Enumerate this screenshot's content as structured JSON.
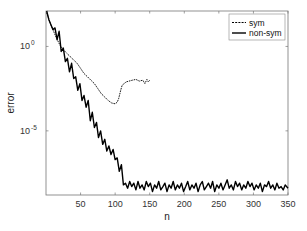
{
  "chart_data": {
    "type": "line",
    "title": "",
    "xlabel": "n",
    "ylabel": "error",
    "xscale": "linear",
    "yscale": "log",
    "xlim": [
      1,
      350
    ],
    "ylim_log10": [
      -8.8,
      2.1
    ],
    "grid": false,
    "legend_position": "upper right",
    "xticks": [
      50,
      100,
      150,
      200,
      250,
      300,
      350
    ],
    "xtick_labels": [
      "50",
      "100",
      "150",
      "200",
      "250",
      "300",
      "350"
    ],
    "yticks_log10": [
      0,
      -5
    ],
    "ytick_labels": [
      {
        "base": "10",
        "exp": "0"
      },
      {
        "base": "10",
        "exp": "-5"
      }
    ],
    "series": [
      {
        "name": "sym",
        "style": "dashed",
        "color": "#000000",
        "n": [
          1,
          5,
          10,
          15,
          20,
          25,
          30,
          35,
          40,
          45,
          50,
          55,
          60,
          65,
          70,
          75,
          80,
          85,
          90,
          95,
          100,
          103,
          105,
          108,
          110,
          113,
          116,
          120,
          125,
          130,
          135,
          140,
          143,
          146,
          148,
          150
        ],
        "log10_error": [
          2.0,
          1.5,
          1.0,
          0.5,
          0.1,
          -0.2,
          -0.4,
          -0.6,
          -0.8,
          -1.0,
          -1.3,
          -1.6,
          -1.8,
          -2.0,
          -2.2,
          -2.5,
          -2.8,
          -3.0,
          -3.2,
          -3.35,
          -3.4,
          -3.3,
          -3.1,
          -2.6,
          -2.3,
          -2.2,
          -2.1,
          -2.05,
          -2.0,
          -1.95,
          -2.05,
          -2.0,
          -2.2,
          -1.95,
          -2.1,
          -2.0
        ]
      },
      {
        "name": "non-sym",
        "style": "solid",
        "color": "#000000",
        "n": [
          1,
          4,
          7,
          10,
          13,
          16,
          19,
          22,
          25,
          28,
          31,
          34,
          37,
          40,
          43,
          46,
          49,
          52,
          55,
          58,
          61,
          64,
          67,
          70,
          73,
          76,
          79,
          82,
          85,
          88,
          91,
          94,
          97,
          100,
          103,
          106,
          109,
          112,
          115,
          118,
          121,
          124,
          127,
          130,
          133,
          136,
          139,
          142,
          145,
          148,
          151,
          154,
          157,
          160,
          163,
          166,
          169,
          172,
          175,
          178,
          181,
          184,
          187,
          190,
          193,
          196,
          199,
          202,
          205,
          208,
          211,
          214,
          217,
          220,
          223,
          226,
          229,
          232,
          235,
          238,
          241,
          244,
          247,
          250,
          253,
          256,
          259,
          262,
          265,
          268,
          271,
          274,
          277,
          280,
          283,
          286,
          289,
          292,
          295,
          298,
          301,
          304,
          307,
          310,
          313,
          316,
          319,
          322,
          325,
          328,
          331,
          334,
          337,
          340,
          343,
          346,
          350
        ],
        "log10_error": [
          2.1,
          1.6,
          1.3,
          1.0,
          1.1,
          0.4,
          0.9,
          -0.3,
          -0.1,
          -0.9,
          -0.7,
          -1.5,
          -1.0,
          -1.9,
          -1.8,
          -2.6,
          -2.2,
          -3.2,
          -2.9,
          -3.6,
          -3.2,
          -4.4,
          -3.9,
          -4.8,
          -4.5,
          -5.4,
          -5.0,
          -5.8,
          -5.5,
          -6.2,
          -5.9,
          -6.4,
          -6.1,
          -6.7,
          -6.6,
          -7.4,
          -7.0,
          -8.2,
          -8.1,
          -8.4,
          -8.0,
          -8.3,
          -8.1,
          -8.5,
          -8.0,
          -8.4,
          -8.2,
          -8.5,
          -8.0,
          -8.3,
          -8.1,
          -8.6,
          -8.2,
          -8.4,
          -8.0,
          -8.5,
          -8.3,
          -8.1,
          -8.6,
          -8.2,
          -8.4,
          -8.0,
          -8.5,
          -8.2,
          -8.4,
          -8.1,
          -8.6,
          -8.3,
          -8.0,
          -8.5,
          -8.2,
          -8.4,
          -8.1,
          -8.6,
          -8.2,
          -8.0,
          -8.5,
          -8.3,
          -8.1,
          -8.4,
          -8.0,
          -8.6,
          -8.2,
          -8.4,
          -8.1,
          -8.5,
          -8.2,
          -7.9,
          -8.4,
          -8.2,
          -8.5,
          -8.0,
          -8.3,
          -8.1,
          -8.5,
          -8.2,
          -8.4,
          -8.0,
          -8.3,
          -8.1,
          -8.5,
          -8.2,
          -8.4,
          -8.1,
          -8.6,
          -8.2,
          -8.3,
          -8.0,
          -8.4,
          -8.2,
          -8.5,
          -8.1,
          -8.4,
          -8.3,
          -8.5,
          -8.2,
          -8.4
        ]
      }
    ]
  },
  "legend": {
    "items": [
      {
        "label": "sym",
        "style": "dashed"
      },
      {
        "label": "non-sym",
        "style": "solid"
      }
    ]
  },
  "colors": {
    "axis": "#555555",
    "line": "#000000",
    "background": "#ffffff"
  }
}
